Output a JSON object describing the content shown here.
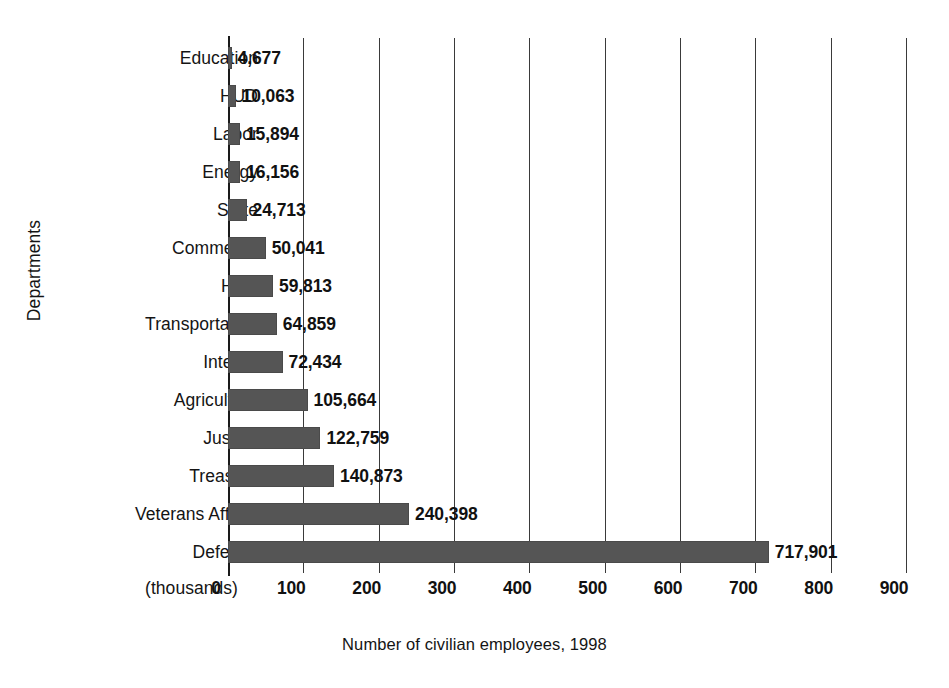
{
  "chart_data": {
    "type": "bar",
    "orientation": "horizontal",
    "title": "",
    "subtitle": "",
    "xlabel": "Number of civilian employees, 1998",
    "ylabel": "Departments",
    "x_unit_note": "(thousands)",
    "xlim": [
      0,
      900
    ],
    "xticks": [
      0,
      100,
      200,
      300,
      400,
      500,
      600,
      700,
      800,
      900
    ],
    "xtick_labels": [
      "0",
      "100",
      "200",
      "300",
      "400",
      "500",
      "600",
      "700",
      "800",
      "900"
    ],
    "grid": true,
    "grid_axis": "x",
    "legend": false,
    "legend_position": "none",
    "bar_color": "#555555",
    "categories": [
      "Education",
      "HUD",
      "Labor",
      "Energy",
      "State",
      "Commerce",
      "HHS",
      "Transportation",
      "Interior",
      "Agriculture",
      "Justice",
      "Treasury",
      "Veterans Affairs",
      "Defense"
    ],
    "values": [
      4677,
      10063,
      15894,
      16156,
      24713,
      50041,
      59813,
      64859,
      72434,
      105664,
      122759,
      140873,
      240398,
      717901
    ],
    "value_labels": [
      "4,677",
      "10,063",
      "15,894",
      "16,156",
      "24,713",
      "50,041",
      "59,813",
      "64,859",
      "72,434",
      "105,664",
      "122,759",
      "140,873",
      "240,398",
      "717,901"
    ]
  }
}
